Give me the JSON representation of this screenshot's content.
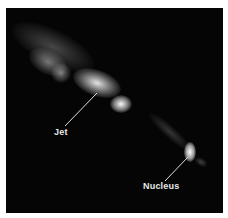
{
  "figure": {
    "background_color": "#050505",
    "label_color": "#e8e8e8",
    "annotations": [
      {
        "label": "Jet",
        "pointer_from": [
          65,
          126
        ],
        "pointer_to": [
          97,
          93
        ]
      },
      {
        "label": "Nucleus",
        "pointer_from": [
          165,
          181
        ],
        "pointer_to": [
          188,
          157
        ]
      }
    ]
  }
}
